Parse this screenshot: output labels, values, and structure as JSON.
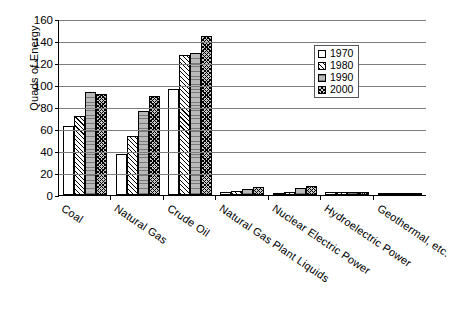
{
  "chart_data": {
    "type": "bar",
    "title": "",
    "xlabel": "",
    "ylabel": "Quads of Energy",
    "ylim": [
      0,
      160
    ],
    "yticks": [
      0,
      20,
      40,
      60,
      80,
      100,
      120,
      140,
      160
    ],
    "grid": true,
    "legend_position": "top-right",
    "categories": [
      "Coal",
      "Natural Gas",
      "Crude Oil",
      "Natural Gas Plant Liquids",
      "Nuclear Electric Power",
      "Hydroelectric Power",
      "Geothermal, etc."
    ],
    "series": [
      {
        "name": "1970",
        "values": [
          63.0,
          37.0,
          96.0,
          2.5,
          0.2,
          2.6,
          0.0
        ]
      },
      {
        "name": "1980",
        "values": [
          72.0,
          54.0,
          127.0,
          4.1,
          2.7,
          3.1,
          0.1
        ]
      },
      {
        "name": "1990",
        "values": [
          94.0,
          76.0,
          129.0,
          5.5,
          6.1,
          3.1,
          0.4
        ]
      },
      {
        "name": "2000",
        "values": [
          92.0,
          90.0,
          145.0,
          7.0,
          8.0,
          2.8,
          0.5
        ]
      }
    ]
  },
  "legend": {
    "items": [
      {
        "label": "1970"
      },
      {
        "label": "1980"
      },
      {
        "label": "1990"
      },
      {
        "label": "2000"
      }
    ]
  }
}
